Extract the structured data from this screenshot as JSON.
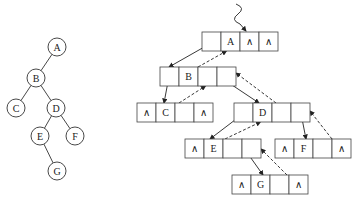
{
  "diagram": {
    "type": "binary tree and its triply-linked (parent pointer) storage structure",
    "null_symbol": "∧",
    "tree": {
      "nodes": [
        {
          "id": "A",
          "label": "A",
          "x": 57,
          "y": 47
        },
        {
          "id": "B",
          "label": "B",
          "x": 36,
          "y": 78
        },
        {
          "id": "C",
          "label": "C",
          "x": 16,
          "y": 108
        },
        {
          "id": "D",
          "label": "D",
          "x": 56,
          "y": 108
        },
        {
          "id": "E",
          "label": "E",
          "x": 40,
          "y": 136
        },
        {
          "id": "F",
          "label": "F",
          "x": 75,
          "y": 136
        },
        {
          "id": "G",
          "label": "G",
          "x": 57,
          "y": 171
        }
      ],
      "edges": [
        [
          "A",
          "B"
        ],
        [
          "B",
          "C"
        ],
        [
          "B",
          "D"
        ],
        [
          "D",
          "E"
        ],
        [
          "D",
          "F"
        ],
        [
          "E",
          "G"
        ]
      ]
    },
    "storage": {
      "cell_order": [
        "parent",
        "data",
        "lchild",
        "rchild"
      ],
      "nodes": [
        {
          "id": "A",
          "x": 202,
          "y": 32,
          "cells": [
            "",
            "A",
            "∧",
            "∧"
          ]
        },
        {
          "id": "B",
          "x": 160,
          "y": 67,
          "cells": [
            "",
            "B",
            "",
            ""
          ]
        },
        {
          "id": "C",
          "x": 137,
          "y": 103,
          "cells": [
            "∧",
            "C",
            "",
            "∧"
          ]
        },
        {
          "id": "D",
          "x": 234,
          "y": 103,
          "cells": [
            "",
            "D",
            "",
            ""
          ]
        },
        {
          "id": "E",
          "x": 185,
          "y": 139,
          "cells": [
            "∧",
            "E",
            "",
            ""
          ]
        },
        {
          "id": "F",
          "x": 275,
          "y": 139,
          "cells": [
            "∧",
            "F",
            "",
            "∧"
          ]
        },
        {
          "id": "G",
          "x": 232,
          "y": 175,
          "cells": [
            "∧",
            "G",
            "",
            "∧"
          ]
        }
      ],
      "entry_pointer": "root"
    }
  }
}
